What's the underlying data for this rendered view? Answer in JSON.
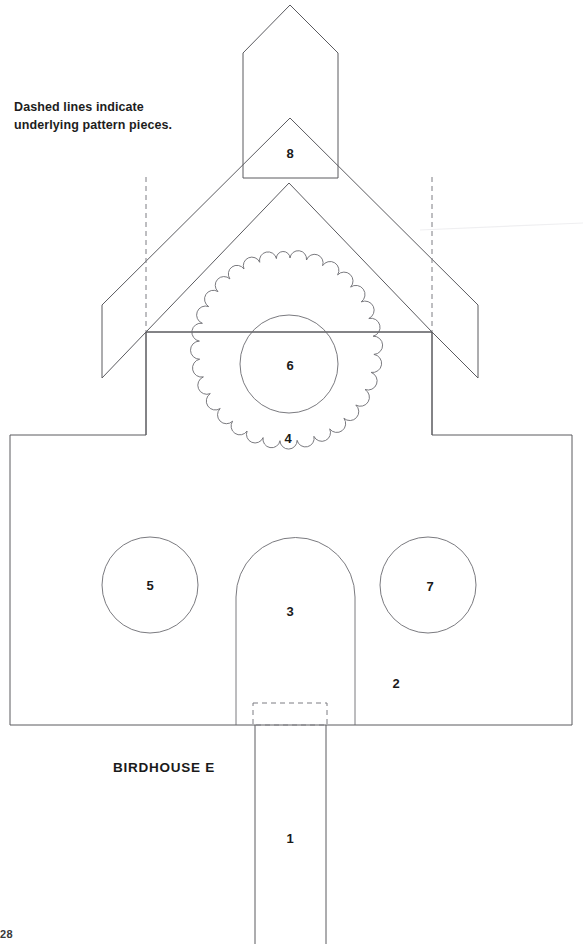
{
  "sheet": {
    "title": "BIRDHOUSE E",
    "page_number": "28",
    "caption_line_1": "Dashed lines indicate",
    "caption_line_2": "underlying pattern pieces.",
    "line_color": "#5a5a5f",
    "background_color": "#ffffff",
    "text_color": "#1a1a1a"
  },
  "pieces": [
    {
      "id": "post",
      "number": "1",
      "name": "mounting-post",
      "label_x": 290,
      "label_y": 840,
      "shape": "rectangle"
    },
    {
      "id": "body",
      "number": "2",
      "name": "house-body",
      "label_x": 396,
      "label_y": 685,
      "shape": "notched-rectangle"
    },
    {
      "id": "door",
      "number": "3",
      "name": "arched-door",
      "label_x": 290,
      "label_y": 613,
      "shape": "arch"
    },
    {
      "id": "scallop",
      "number": "4",
      "name": "scalloped-medallion",
      "label_x": 288,
      "label_y": 440,
      "shape": "scalloped-circle",
      "scallop_count": 20
    },
    {
      "id": "left-circle",
      "number": "5",
      "name": "left-window-circle",
      "label_x": 150,
      "label_y": 587,
      "shape": "circle"
    },
    {
      "id": "inner-circle",
      "number": "6",
      "name": "center-entry-hole",
      "label_x": 290,
      "label_y": 367,
      "shape": "circle"
    },
    {
      "id": "right-circle",
      "number": "7",
      "name": "right-window-circle",
      "label_x": 430,
      "label_y": 588,
      "shape": "circle"
    },
    {
      "id": "chimney",
      "number": "8",
      "name": "chimney-and-roof",
      "label_x": 290,
      "label_y": 155,
      "shape": "pentagon-with-roof"
    }
  ]
}
